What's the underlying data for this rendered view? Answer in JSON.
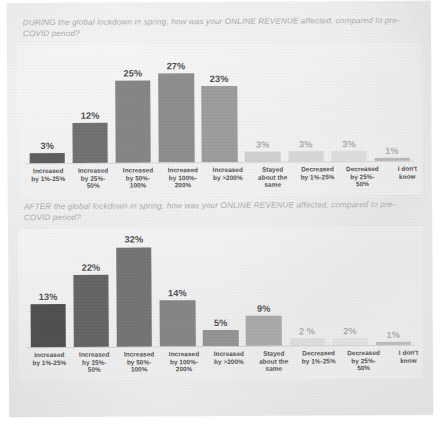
{
  "document": {
    "type": "survey-results-page",
    "background_color": "#eaeaeb",
    "title_color": "#a7a7a9",
    "label_color": "#4e4e50"
  },
  "charts": [
    {
      "id": "during-lockdown",
      "question": "DURING the global lockdown in spring, how was your ONLINE REVENUE affected, compared to pre-COVID period?"
    },
    {
      "id": "after-lockdown",
      "question": "AFTER the global lockdown in spring, how was your ONLINE REVENUE affected, compared to pre-COVID period?"
    }
  ],
  "chart_data": [
    {
      "type": "bar",
      "id": "during-lockdown",
      "title": "DURING the global lockdown in spring, how was your ONLINE REVENUE affected, compared to pre-COVID period?",
      "xlabel": "",
      "ylabel": "",
      "ylim": [
        0,
        34
      ],
      "grid": false,
      "legend": "none",
      "value_suffix": "%",
      "categories": [
        "Increased by 1%-25%",
        "Increased by 25%-50%",
        "Increased by 50%-100%",
        "Increased by 100%-200%",
        "Increased by >200%",
        "Stayed about the same",
        "Decreased by 1%-25%",
        "Decreased by 25%-50%",
        "I don't know"
      ],
      "category_lines": [
        [
          "Increased",
          "by 1%-25%"
        ],
        [
          "Increased",
          "by 25%-",
          "50%"
        ],
        [
          "Increased",
          "by 50%-",
          "100%"
        ],
        [
          "Increased",
          "by 100%-",
          "200%"
        ],
        [
          "Increased",
          "by >200%"
        ],
        [
          "Stayed",
          "about the",
          "same"
        ],
        [
          "Decreased",
          "by 1%-25%"
        ],
        [
          "Decreased",
          "by 25%-",
          "50%"
        ],
        [
          "I don't",
          "know"
        ]
      ],
      "values": [
        3,
        12,
        25,
        27,
        23,
        3,
        3,
        3,
        1
      ],
      "value_labels": [
        "3%",
        "12%",
        "25%",
        "27%",
        "23%",
        "3%",
        "3%",
        "3%",
        "1%"
      ],
      "bar_colors": [
        "#5c5c5e",
        "#6f6f71",
        "#848486",
        "#8c8c8e",
        "#9b9b9d",
        "#cfcfd1",
        "#d6d6d8",
        "#dcdcde",
        "#b9b9bb"
      ],
      "label_faint": [
        false,
        false,
        false,
        false,
        false,
        true,
        true,
        true,
        true
      ]
    },
    {
      "type": "bar",
      "id": "after-lockdown",
      "title": "AFTER the global lockdown in spring, how was your ONLINE REVENUE affected, compared to pre-COVID period?",
      "xlabel": "",
      "ylabel": "",
      "ylim": [
        0,
        34
      ],
      "grid": false,
      "legend": "none",
      "value_suffix": "%",
      "categories": [
        "Increased by 1%-25%",
        "Increased by 25%-50%",
        "Increased by 50%-100%",
        "Increased by 100%-200%",
        "Increased by >200%",
        "Stayed about the same",
        "Decreased by 1%-25%",
        "Decreased by 25%-50%",
        "I don't know"
      ],
      "category_lines": [
        [
          "Increased",
          "by 1%-25%"
        ],
        [
          "Increased",
          "by 25%-",
          "50%"
        ],
        [
          "Increased",
          "by 50%-",
          "100%"
        ],
        [
          "Increased",
          "by 100%-",
          "200%"
        ],
        [
          "Increased",
          "by >200%"
        ],
        [
          "Stayed",
          "about the",
          "same"
        ],
        [
          "Decreased",
          "by 1%-25%"
        ],
        [
          "Decreased",
          "by 25%-",
          "50%"
        ],
        [
          "I don't",
          "know"
        ]
      ],
      "values": [
        13,
        22,
        32,
        14,
        5,
        9,
        2,
        2,
        1
      ],
      "value_labels": [
        "13%",
        "22%",
        "32%",
        "14%",
        "5%",
        "9%",
        "2 %",
        "2%",
        "1%"
      ],
      "bar_colors": [
        "#4e4e50",
        "#636365",
        "#727274",
        "#848486",
        "#929294",
        "#a8a8aa",
        "#dcdcde",
        "#e0e0e2",
        "#bdbdbf"
      ],
      "label_faint": [
        false,
        false,
        false,
        false,
        false,
        false,
        true,
        true,
        true
      ]
    }
  ]
}
